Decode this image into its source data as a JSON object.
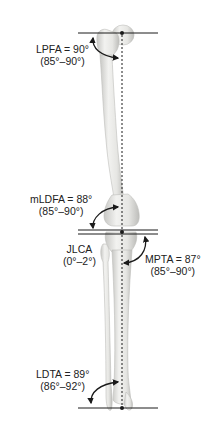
{
  "measurements": [
    {
      "id": "lpfa",
      "name": "LPFA",
      "value_text": "LPFA = 90°",
      "range_text": "(85°–90°)",
      "value_deg": 90,
      "range_deg": [
        85,
        90
      ]
    },
    {
      "id": "mldfa",
      "name": "mLDFA",
      "value_text": "mLDFA = 88°",
      "range_text": "(85°–90°)",
      "value_deg": 88,
      "range_deg": [
        85,
        90
      ]
    },
    {
      "id": "jlca",
      "name": "JLCA",
      "value_text": "JLCA",
      "range_text": "(0°–2°)",
      "range_deg": [
        0,
        2
      ]
    },
    {
      "id": "mpta",
      "name": "MPTA",
      "value_text": "MPTA = 87°",
      "range_text": "(85°–90°)",
      "value_deg": 87,
      "range_deg": [
        85,
        90
      ]
    },
    {
      "id": "ldta",
      "name": "LDTA",
      "value_text": "LDTA = 89°",
      "range_text": "(86°–92°)",
      "value_deg": 89,
      "range_deg": [
        86,
        92
      ]
    }
  ],
  "colors": {
    "bone_fill": "#ececea",
    "bone_shadow": "#c9c9c6",
    "line": "#1a1a1a",
    "text": "#222222",
    "background": "#ffffff"
  }
}
